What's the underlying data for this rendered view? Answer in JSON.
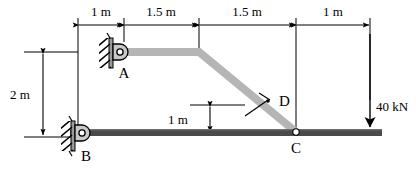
{
  "diagram": {
    "members": {
      "bottom_bar": {
        "name": "bottom-beam",
        "color": "#4a4a4a"
      },
      "inclined_member": {
        "name": "member-A-C",
        "color": "#b5b5b5"
      }
    },
    "supports": [
      {
        "id": "A",
        "label": "A",
        "type": "pin-support",
        "hatch_side": "left"
      },
      {
        "id": "B",
        "label": "B",
        "type": "pin-support",
        "hatch_side": "left"
      }
    ],
    "joints": [
      {
        "id": "C",
        "label": "C",
        "type": "pin-joint"
      },
      {
        "id": "D",
        "label": "D",
        "type": "section-cut"
      }
    ],
    "horizontal_dimensions": [
      {
        "label": "1 m",
        "value": 1,
        "unit": "m"
      },
      {
        "label": "1.5 m",
        "value": 1.5,
        "unit": "m"
      },
      {
        "label": "1.5 m",
        "value": 1.5,
        "unit": "m"
      },
      {
        "label": "1 m",
        "value": 1,
        "unit": "m"
      }
    ],
    "vertical_dimensions": [
      {
        "label": "2 m",
        "value": 2,
        "unit": "m",
        "position": "left"
      },
      {
        "label": "1 m",
        "value": 1,
        "unit": "m",
        "position": "middle"
      }
    ],
    "loads": [
      {
        "label": "40 kN",
        "magnitude": 40,
        "unit": "kN",
        "direction": "down",
        "applied_at": "right-end-of-beam"
      }
    ],
    "colors": {
      "line": "#000000",
      "beam_dark": "#4a4a4a",
      "beam_light": "#b5b5b5",
      "support_fill": "#c8c8c8",
      "background": "#ffffff"
    }
  }
}
